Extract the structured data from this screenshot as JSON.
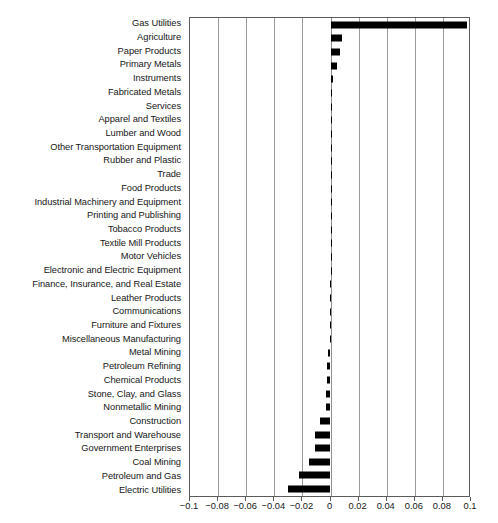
{
  "chart_data": {
    "type": "bar",
    "orientation": "horizontal",
    "title": "",
    "xlabel": "",
    "ylabel": "",
    "xlim": [
      -0.1,
      0.1
    ],
    "xticks": [
      -0.1,
      -0.08,
      -0.06,
      -0.04,
      -0.02,
      0,
      0.02,
      0.04,
      0.06,
      0.08,
      0.1
    ],
    "xticklabels": [
      "-0.1",
      "-0.08",
      "-0.06",
      "-0.04",
      "-0.02",
      "0",
      "0.02",
      "0.04",
      "0.06",
      "0.08",
      "0.1"
    ],
    "grid": true,
    "grid_axis": "x",
    "legend": false,
    "bar_color": "#000000",
    "categories": [
      "Gas Utilities",
      "Agriculture",
      "Paper Products",
      "Primary Metals",
      "Instruments",
      "Fabricated Metals",
      "Services",
      "Apparel and Textiles",
      "Lumber and Wood",
      "Other Transportation Equipment",
      "Rubber and Plastic",
      "Trade",
      "Food Products",
      "Industrial Machinery and Equipment",
      "Printing and Publishing",
      "Tobacco Products",
      "Textile Mill Products",
      "Motor Vehicles",
      "Electronic and Electric Equipment",
      "Finance, Insurance, and Real Estate",
      "Leather Products",
      "Communications",
      "Furniture and Fixtures",
      "Miscellaneous Manufacturing",
      "Metal Mining",
      "Petroleum Refining",
      "Chemical Products",
      "Stone, Clay, and Glass",
      "Nonmetallic Mining",
      "Construction",
      "Transport and Warehouse",
      "Government Enterprises",
      "Coal Mining",
      "Petroleum and Gas",
      "Electric Utilities"
    ],
    "values": [
      0.097,
      0.0085,
      0.0065,
      0.0045,
      0.002,
      0.0012,
      0.0008,
      0.0006,
      0.0005,
      0.0004,
      0.0003,
      0.0002,
      0.0002,
      0.0001,
      0.0001,
      0.0001,
      0.0,
      0.0,
      0.0,
      -0.0001,
      -0.0001,
      -0.0002,
      -0.0003,
      -0.0004,
      -0.0018,
      -0.0022,
      -0.0026,
      -0.0029,
      -0.0032,
      -0.0078,
      -0.0112,
      -0.0112,
      -0.0155,
      -0.0225,
      -0.0302
    ]
  }
}
